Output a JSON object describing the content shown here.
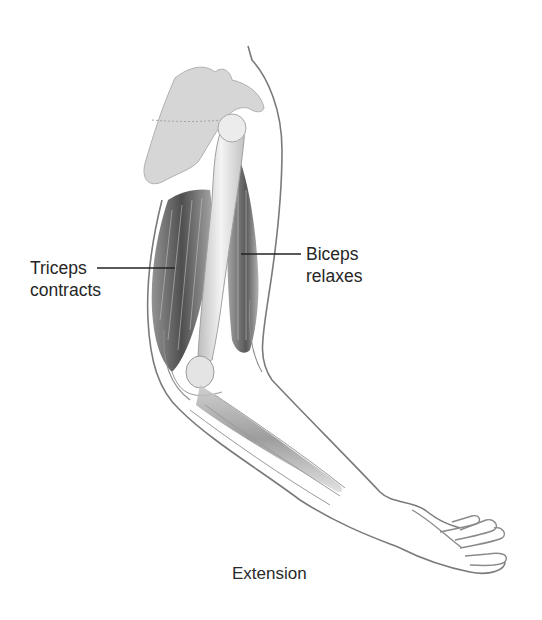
{
  "diagram": {
    "title": "Extension",
    "labels": [
      {
        "id": "triceps",
        "lines": [
          "Triceps",
          "contracts"
        ]
      },
      {
        "id": "biceps",
        "lines": [
          "Biceps",
          "relaxes"
        ]
      }
    ],
    "colors": {
      "outline": "#7a7a7a",
      "muscle_dark": "#4a4a4a",
      "bone_fill": "#e6e6e6",
      "scapula_fill": "#d4d4d4",
      "leader_line": "#222222",
      "text": "#2a2a2a",
      "background": "#ffffff"
    }
  }
}
